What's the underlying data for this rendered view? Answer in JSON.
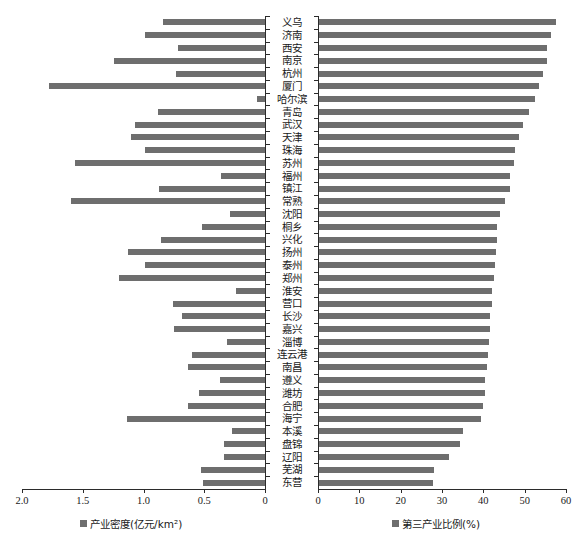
{
  "chart_data": {
    "type": "bar",
    "title": "",
    "orientation": "horizontal",
    "layout": "mirrored-bidirectional",
    "grid": false,
    "categories": [
      "义乌",
      "济南",
      "西安",
      "南京",
      "杭州",
      "厦门",
      "哈尔滨",
      "青岛",
      "武汉",
      "天津",
      "珠海",
      "苏州",
      "福州",
      "镇江",
      "常熟",
      "沈阳",
      "桐乡",
      "兴化",
      "扬州",
      "泰州",
      "郑州",
      "淮安",
      "营口",
      "长沙",
      "嘉兴",
      "淄博",
      "连云港",
      "南昌",
      "遵义",
      "潍坊",
      "合肥",
      "海宁",
      "本溪",
      "盘锦",
      "辽阳",
      "芜湖",
      "东营"
    ],
    "series": [
      {
        "name": "产业密度(亿元/km²)",
        "unit": "亿元/km²",
        "axis": "left",
        "direction": "left",
        "color": "#6e6e6e",
        "axis_label": "产业密度(亿元/km²)",
        "xlim": [
          0,
          2.0
        ],
        "ticks": [
          "2.0",
          "1.5",
          "1.0",
          "0.5",
          "0"
        ],
        "tick_values": [
          2.0,
          1.5,
          1.0,
          0.5,
          0
        ],
        "reversed": true,
        "values": [
          0.84,
          0.99,
          0.72,
          1.24,
          0.73,
          1.78,
          0.07,
          0.88,
          1.07,
          1.1,
          0.99,
          1.56,
          0.36,
          0.87,
          1.6,
          0.29,
          0.52,
          0.86,
          1.13,
          0.99,
          1.2,
          0.24,
          0.76,
          0.68,
          0.75,
          0.31,
          0.6,
          0.63,
          0.37,
          0.54,
          0.63,
          1.14,
          0.27,
          0.34,
          0.34,
          0.53,
          0.51
        ]
      },
      {
        "name": "第三产业比例(%)",
        "unit": "%",
        "axis": "right",
        "direction": "right",
        "color": "#6e6e6e",
        "axis_label": "第三产业比例(%)",
        "xlim": [
          0,
          60
        ],
        "ticks": [
          "0",
          "10",
          "20",
          "30",
          "40",
          "50",
          "60"
        ],
        "tick_values": [
          0,
          10,
          20,
          30,
          40,
          50,
          60
        ],
        "reversed": false,
        "values": [
          57.5,
          56.4,
          55.5,
          55.3,
          54.5,
          53.5,
          52.5,
          51.0,
          49.5,
          48.6,
          47.6,
          47.5,
          46.5,
          46.4,
          45.3,
          44.0,
          43.3,
          43.2,
          43.0,
          42.9,
          42.5,
          42.1,
          42.0,
          41.7,
          41.6,
          41.4,
          41.2,
          40.8,
          40.4,
          40.3,
          39.8,
          39.5,
          35.0,
          34.3,
          31.8,
          28.0,
          27.8
        ]
      }
    ]
  },
  "axes": {
    "left": {
      "label": "产业密度(亿元/km²)",
      "label_main": "产业密度(亿元/km",
      "label_sup": "2",
      "label_tail": ")",
      "ticks": [
        "2.0",
        "1.5",
        "1.0",
        "0.5",
        "0"
      ]
    },
    "right": {
      "label": "第三产业比例(%)",
      "ticks": [
        "0",
        "10",
        "20",
        "30",
        "40",
        "50",
        "60"
      ]
    }
  },
  "legend": {
    "left": {
      "marker": "square-marker",
      "text": "产业密度(亿元/km²)"
    },
    "right": {
      "marker": "square-marker",
      "text": "第三产业比例(%)"
    }
  },
  "colors": {
    "bar": "#6e6e6e",
    "axis": "#2b2b2b",
    "background": "#ffffff"
  }
}
